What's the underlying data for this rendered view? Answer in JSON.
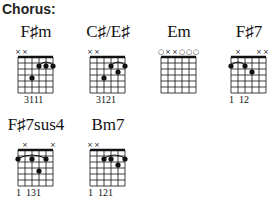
{
  "heading": "Chorus:",
  "chords": [
    {
      "name": "F♯m",
      "markers": [
        "x",
        "x",
        "",
        "",
        "",
        ""
      ],
      "dots": [
        [
          4,
          4
        ],
        [
          3,
          2
        ],
        [
          2,
          2
        ],
        [
          1,
          2
        ]
      ],
      "barre": [
        3,
        1,
        2
      ],
      "fingering": "3111",
      "x": 18,
      "y": 22
    },
    {
      "name": "C♯/E♯",
      "markers": [
        "x",
        "x",
        "",
        "",
        "",
        ""
      ],
      "dots": [
        [
          4,
          4
        ],
        [
          3,
          2
        ],
        [
          2,
          3
        ],
        [
          1,
          2
        ]
      ],
      "barre": [
        3,
        1,
        2
      ],
      "fingering": "3121",
      "x": 90,
      "y": 22
    },
    {
      "name": "Em",
      "markers": [
        "o",
        "x",
        "x",
        "o",
        "o",
        "o"
      ],
      "dots": [],
      "barre": null,
      "fingering": "",
      "x": 161,
      "y": 22
    },
    {
      "name": "F♯7",
      "markers": [
        "",
        "x",
        "",
        "",
        "x",
        "x"
      ],
      "dots": [
        [
          6,
          2
        ],
        [
          4,
          2
        ],
        [
          3,
          3
        ]
      ],
      "barre": [
        6,
        4,
        2
      ],
      "fingering": "1  12",
      "x": 231,
      "y": 22
    },
    {
      "name": "F♯7sus4",
      "markers": [
        "",
        "x",
        "",
        "",
        "",
        "x"
      ],
      "dots": [
        [
          6,
          2
        ],
        [
          4,
          2
        ],
        [
          3,
          4
        ],
        [
          2,
          2
        ]
      ],
      "barre": [
        6,
        2,
        2
      ],
      "fingering": "1  131",
      "x": 18,
      "y": 115
    },
    {
      "name": "Bm7",
      "markers": [
        "x",
        "x",
        "",
        "",
        "",
        ""
      ],
      "dots": [
        [
          4,
          2
        ],
        [
          3,
          2
        ],
        [
          2,
          3
        ],
        [
          1,
          2
        ]
      ],
      "barre": [
        4,
        1,
        2
      ],
      "fingering": "1  121",
      "x": 90,
      "y": 115
    }
  ],
  "colors": {
    "ink": "#111111",
    "background": "#ffffff"
  }
}
